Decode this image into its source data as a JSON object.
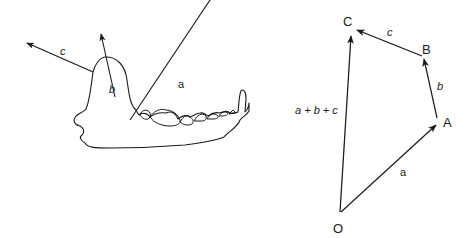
{
  "figure": {
    "left_panel": {
      "subject": "jaw-bone-with-muscle-force-vectors",
      "vectors": [
        {
          "id": "a",
          "label": "a"
        },
        {
          "id": "b",
          "label": "b"
        },
        {
          "id": "c",
          "label": "c"
        }
      ]
    },
    "right_panel": {
      "subject": "vector-addition-polygon",
      "points": {
        "O": "O",
        "A": "A",
        "B": "B",
        "C": "C"
      },
      "vector_labels": {
        "a": "a",
        "b": "b",
        "c": "c",
        "resultant": "a + b + c"
      }
    },
    "colors": {
      "stroke": "#1a1a1a",
      "background": "#ffffff"
    }
  }
}
